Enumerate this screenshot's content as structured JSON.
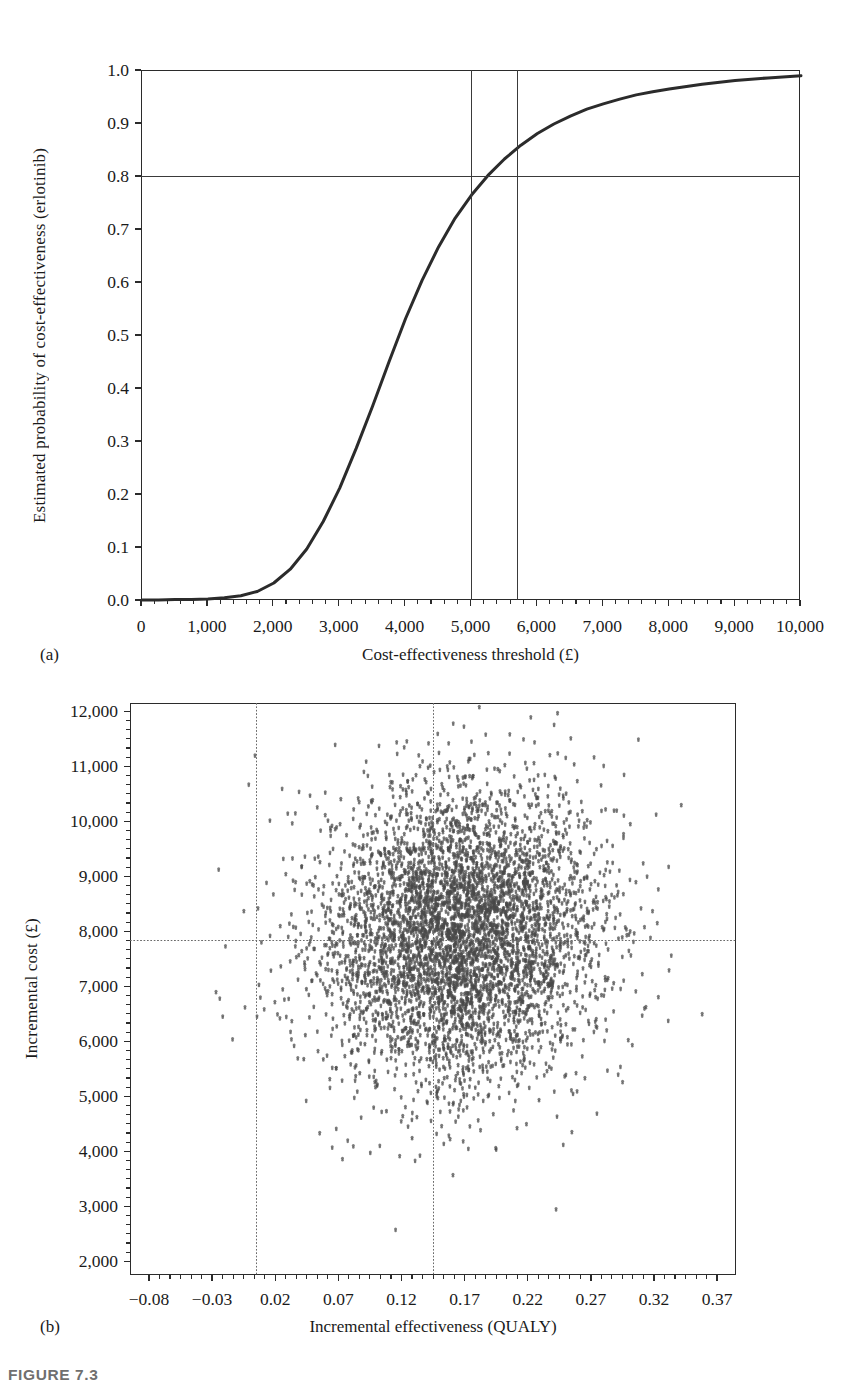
{
  "figure": {
    "caption": "FIGURE 7.3",
    "panel_a_tag": "(a)",
    "panel_b_tag": "(b)"
  },
  "chart_data": [
    {
      "id": "ceac",
      "type": "line",
      "title": "",
      "xlabel": "Cost-effectiveness threshold (£)",
      "ylabel": "Estimated probability of cost-effectiveness (erlotinib)",
      "xlim": [
        0,
        10000
      ],
      "ylim": [
        0.0,
        1.0
      ],
      "grid": false,
      "legend": "none",
      "xticks": [
        0,
        1000,
        2000,
        3000,
        4000,
        5000,
        6000,
        7000,
        8000,
        9000,
        10000
      ],
      "xticklabels": [
        "0",
        "1,000",
        "2,000",
        "3,000",
        "4,000",
        "5,000",
        "6,000",
        "7,000",
        "8,000",
        "9,000",
        "10,000"
      ],
      "yticks": [
        0.0,
        0.1,
        0.2,
        0.3,
        0.4,
        0.5,
        0.6,
        0.7,
        0.8,
        0.9,
        1.0
      ],
      "yticklabels": [
        "0.0",
        "0.1",
        "0.2",
        "0.3",
        "0.4",
        "0.5",
        "0.6",
        "0.7",
        "0.8",
        "0.9",
        "1.0"
      ],
      "x_minor_per_major": 4,
      "y_minor_per_major": 0,
      "series": [
        {
          "name": "CEAC (erlotinib)",
          "color": "#2b2b2b",
          "width": 3.0,
          "x": [
            0,
            250,
            500,
            750,
            1000,
            1250,
            1500,
            1750,
            2000,
            2250,
            2500,
            2750,
            3000,
            3250,
            3500,
            3750,
            4000,
            4250,
            4500,
            4750,
            5000,
            5250,
            5500,
            5750,
            6000,
            6250,
            6500,
            6750,
            7000,
            7250,
            7500,
            7750,
            8000,
            8500,
            9000,
            9500,
            10000
          ],
          "y": [
            0.002,
            0.002,
            0.003,
            0.003,
            0.004,
            0.006,
            0.01,
            0.018,
            0.034,
            0.06,
            0.098,
            0.15,
            0.213,
            0.288,
            0.368,
            0.452,
            0.533,
            0.605,
            0.668,
            0.722,
            0.766,
            0.803,
            0.834,
            0.86,
            0.882,
            0.9,
            0.915,
            0.928,
            0.938,
            0.947,
            0.955,
            0.961,
            0.966,
            0.975,
            0.982,
            0.987,
            0.991
          ]
        }
      ],
      "reference_lines": [
        {
          "name": "probability-0.8-line",
          "orientation": "horizontal",
          "value": 0.8,
          "style": "solid"
        },
        {
          "name": "threshold-5000-line",
          "orientation": "vertical",
          "value": 5000,
          "style": "solid"
        },
        {
          "name": "threshold-5700-line",
          "orientation": "vertical",
          "value": 5700,
          "style": "solid"
        }
      ]
    },
    {
      "id": "ce-plane",
      "type": "scatter",
      "title": "",
      "xlabel": "Incremental effectiveness (QUALY)",
      "ylabel": "Incremental cost (£)",
      "xlim": [
        -0.095,
        0.385
      ],
      "ylim": [
        1750,
        12150
      ],
      "grid": false,
      "legend": "none",
      "xticks": [
        -0.08,
        -0.03,
        0.02,
        0.07,
        0.12,
        0.17,
        0.22,
        0.27,
        0.32,
        0.37
      ],
      "xticklabels": [
        "−0.08",
        "−0.03",
        "0.02",
        "0.07",
        "0.12",
        "0.17",
        "0.22",
        "0.27",
        "0.32",
        "0.37"
      ],
      "yticks": [
        2000,
        3000,
        4000,
        5000,
        6000,
        7000,
        8000,
        9000,
        10000,
        11000,
        12000
      ],
      "yticklabels": [
        "2,000",
        "3,000",
        "4,000",
        "5,000",
        "6,000",
        "7,000",
        "8,000",
        "9,000",
        "10,000",
        "11,000",
        "12,000"
      ],
      "x_minor_per_major": 5,
      "y_minor_per_major": 5,
      "point_count": 5000,
      "point_color": "#4a4a4a",
      "point_radius": 1.5,
      "cloud": {
        "mean_x": 0.165,
        "mean_y": 7900,
        "sd_x": 0.055,
        "sd_y": 1350,
        "correlation": 0.05
      },
      "reference_lines": [
        {
          "name": "effectiveness-lower-line",
          "orientation": "vertical",
          "value": 0.005,
          "style": "dotted"
        },
        {
          "name": "effectiveness-mean-line",
          "orientation": "vertical",
          "value": 0.145,
          "style": "dotted"
        },
        {
          "name": "cost-mean-line",
          "orientation": "horizontal",
          "value": 7850,
          "style": "dotted"
        }
      ]
    }
  ]
}
